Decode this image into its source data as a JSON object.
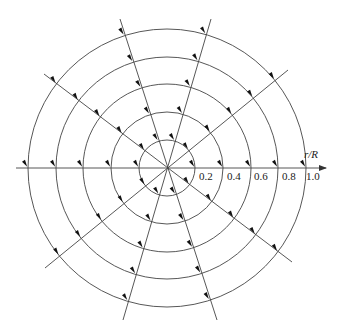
{
  "diagram": {
    "type": "polar-flow-field",
    "center": [
      167,
      168
    ],
    "circles": [
      {
        "r_over_R": 0.2,
        "radius_px": 28
      },
      {
        "r_over_R": 0.4,
        "radius_px": 56
      },
      {
        "r_over_R": 0.6,
        "radius_px": 84
      },
      {
        "r_over_R": 0.8,
        "radius_px": 111
      },
      {
        "r_over_R": 1.0,
        "radius_px": 139
      }
    ],
    "radial_lines": [
      {
        "from": [
          16,
          168
        ],
        "to": [
          326,
          168
        ],
        "arrowhead": true
      },
      {
        "from": [
          120,
          19
        ],
        "to": [
          217,
          320
        ]
      },
      {
        "from": [
          211,
          19
        ],
        "to": [
          123,
          320
        ]
      },
      {
        "from": [
          44,
          74
        ],
        "to": [
          292,
          262
        ]
      },
      {
        "from": [
          288,
          70
        ],
        "to": [
          45,
          268
        ]
      }
    ],
    "axis": {
      "title": "r/R",
      "tick_labels": [
        {
          "text": "0.2",
          "x": 199
        },
        {
          "text": "0.4",
          "x": 227
        },
        {
          "text": "0.6",
          "x": 254
        },
        {
          "text": "0.8",
          "x": 282
        },
        {
          "text": "1.0",
          "x": 306
        }
      ]
    },
    "arrow_marker": {
      "description": "small filled arrowheads at each circle/line intersection pointing down-right",
      "color": "#111111"
    },
    "colors": {
      "line": "#444444",
      "text": "#222222"
    }
  }
}
